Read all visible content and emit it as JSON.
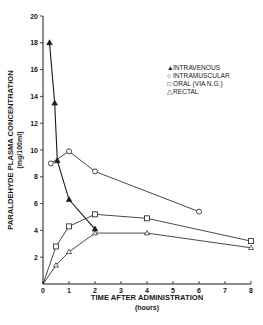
{
  "chart_data": {
    "type": "line",
    "title": "",
    "xlabel": "TIME AFTER ADMINISTRATION",
    "xlabel_sub": "(hours)",
    "ylabel": "PARALDEHYDE PLASMA CONCENTRATION",
    "ylabel_sub": "(mg/100ml)",
    "xlim": [
      0,
      8
    ],
    "ylim": [
      0,
      20
    ],
    "x_ticks": [
      0,
      1,
      2,
      3,
      4,
      5,
      6,
      7,
      8
    ],
    "y_ticks": [
      2,
      4,
      6,
      8,
      10,
      12,
      14,
      16,
      18,
      20
    ],
    "grid": false,
    "legend_position": "upper right",
    "series": [
      {
        "name": "INTRAVENOUS",
        "marker": "filled-triangle",
        "x": [
          0.25,
          0.45,
          0.55,
          1,
          2
        ],
        "y": [
          18,
          13.5,
          9.2,
          6.3,
          4.1
        ]
      },
      {
        "name": "INTRAMUSCULAR",
        "marker": "open-circle",
        "x": [
          0.3,
          1,
          2,
          6
        ],
        "y": [
          9,
          9.9,
          8.4,
          5.4
        ]
      },
      {
        "name": "ORAL (VIA N.G.)",
        "marker": "open-square",
        "x": [
          0,
          0.5,
          1,
          2,
          4,
          8
        ],
        "y": [
          0,
          2.8,
          4.3,
          5.2,
          4.9,
          3.2
        ]
      },
      {
        "name": "RECTAL",
        "marker": "open-triangle",
        "x": [
          0,
          0.5,
          1,
          2,
          4,
          8
        ],
        "y": [
          0,
          1.4,
          2.4,
          3.8,
          3.8,
          2.7
        ]
      }
    ]
  },
  "legend": [
    {
      "symbol": "▲",
      "label": "INTRAVENOUS"
    },
    {
      "symbol": "○",
      "label": "INTRAMUSCULAR"
    },
    {
      "symbol": "□",
      "label": "ORAL (VIA N.G.)"
    },
    {
      "symbol": "△",
      "label": "RECTAL"
    }
  ],
  "colors": {
    "ink": "#1a1a1a",
    "background": "#ffffff"
  }
}
